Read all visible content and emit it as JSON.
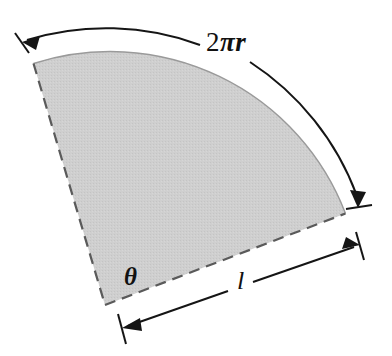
{
  "figure": {
    "background_color": "#ffffff",
    "sector": {
      "fill_color": "#cdcdcd",
      "stroke_color": "#4a4a4a",
      "radius_edge_style": "dashed",
      "arc_edge_style": "solid"
    },
    "labels": {
      "arc_length": "2πr",
      "arc_length_number": "2",
      "arc_length_symbols": "πr",
      "angle": "θ",
      "slant_length": "l"
    },
    "dimensions": [
      {
        "name": "arc-dimension",
        "label": "2πr",
        "kind": "arc",
        "arrow_heads": [
          "start",
          "end"
        ]
      },
      {
        "name": "slant-dimension",
        "label": "l",
        "kind": "line",
        "arrow_heads": [
          "start",
          "end"
        ]
      },
      {
        "name": "angle-marker",
        "label": "θ",
        "kind": "angle"
      }
    ],
    "line_color": "#111111"
  }
}
